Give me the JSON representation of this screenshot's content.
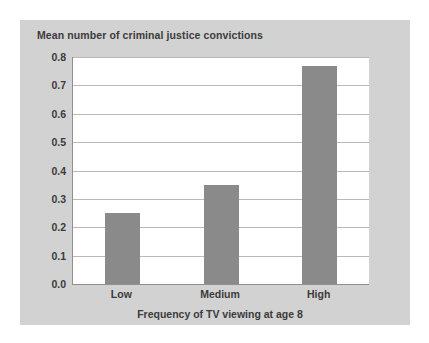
{
  "chart_data": {
    "type": "bar",
    "title": "Mean number of criminal justice convictions",
    "xlabel": "Frequency of TV viewing at age 8",
    "ylabel": "",
    "categories": [
      "Low",
      "Medium",
      "High"
    ],
    "values": [
      0.25,
      0.35,
      0.77
    ],
    "ylim": [
      0.0,
      0.8
    ],
    "ytick_labels": [
      "0.0",
      "0.1",
      "0.2",
      "0.3",
      "0.4",
      "0.5",
      "0.6",
      "0.7",
      "0.8"
    ],
    "ytick_values": [
      0.0,
      0.1,
      0.2,
      0.3,
      0.4,
      0.5,
      0.6,
      0.7,
      0.8
    ],
    "grid": "horizontal",
    "legend": "none",
    "colors": {
      "bar": "#8a8a8a",
      "panel_background": "#d2d2d2",
      "plot_background": "#ffffff",
      "gridline": "#b9b9b9",
      "axis": "#8f8f8f",
      "text": "#3b3b3b"
    }
  }
}
